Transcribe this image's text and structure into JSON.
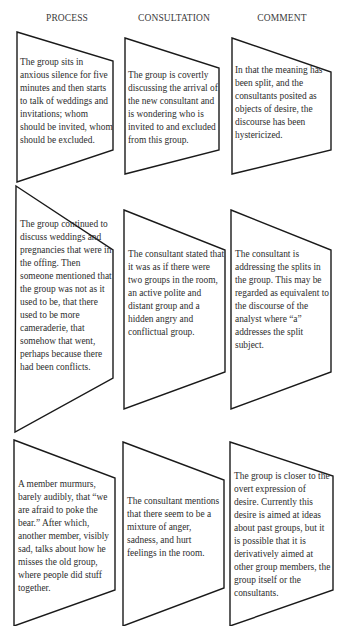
{
  "headers": {
    "process": "PROCESS",
    "consultation": "CONSULTATION",
    "comment": "COMMENT"
  },
  "rows": [
    {
      "process": "The group sits in anxious silence for five minutes and then starts to talk of weddings and invitations; whom should be invited, whom should be excluded.",
      "consultation": "The group is covertly discussing the arrival of the new consultant and is wondering who is invited to and excluded from this group.",
      "comment": "In that the meaning has been split, and the consultants posited as objects of desire, the discourse has been hystericized."
    },
    {
      "process": "The group continued to discuss weddings and pregnancies that were in the offing. Then someone mentioned that the group was not as it used to be, that there used to be more cameraderie, that somehow that went, perhaps because there had been conflicts.",
      "consultation": "The consultant stated that it was as if there were two groups in the room, an active polite and distant group and a hidden angry and conflictual group.",
      "comment": "The consultant is addressing the splits in the group. This may be regarded as equivalent to the discourse of the analyst where “a” addresses the split subject."
    },
    {
      "process": "A member murmurs, barely audibly, that “we are afraid to poke the bear.” After which, another member, visibly sad, talks about how he misses the old group, where people did stuff together.",
      "consultation": "The consultant mentions that there seem to be a mixture of anger, sadness, and hurt feelings in the room.",
      "comment": "The group is closer to the overt expression of desire. Currently this desire is aimed at ideas about past groups, but it is possible that it is derivatively aimed at other group members, the group itself or the consultants."
    }
  ]
}
